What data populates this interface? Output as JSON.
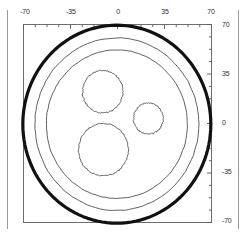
{
  "figure": {
    "background_color": "#ffffff",
    "frame_color": "#6e6e6e",
    "margin_rule_color": "#9a9a9a"
  },
  "axes": {
    "top": {
      "labels": [
        "-70",
        "-35",
        "0",
        "35",
        "70"
      ],
      "values": [
        -70,
        -35,
        0,
        35,
        70
      ]
    },
    "right": {
      "labels": [
        "70",
        "35",
        "0",
        "-35",
        "-70"
      ],
      "values": [
        70,
        35,
        0,
        -35,
        -70
      ]
    },
    "minor_ticks_per_interval": 4
  },
  "chart_data": {
    "type": "line",
    "xlabel": "",
    "ylabel": "",
    "xlim": [
      -70,
      70
    ],
    "ylim": [
      -70,
      70
    ],
    "grid": false,
    "legend": "none",
    "x_ticks": [
      -70,
      -35,
      0,
      35,
      70
    ],
    "y_ticks": [
      -70,
      -35,
      0,
      35,
      70
    ],
    "x_tick_labels": [
      "-70",
      "-35",
      "0",
      "35",
      "70"
    ],
    "y_tick_labels": [
      "-70",
      "-35",
      "0",
      "35",
      "70"
    ],
    "minor_tick_step": 8.75,
    "units": "mm",
    "series": [
      {
        "name": "outer-sheath",
        "shape": "circle",
        "center": [
          -0.5,
          -0.5
        ],
        "radius": 70.0,
        "stroke": "#111111",
        "stroke_width": 3.2,
        "roughness": 0.0
      },
      {
        "name": "outer-insulation",
        "shape": "circle",
        "center": [
          -0.5,
          -0.5
        ],
        "radius": 61.0,
        "stroke": "#3a3a3a",
        "stroke_width": 0.8,
        "roughness": 0.6
      },
      {
        "name": "inner-bedding",
        "shape": "circle",
        "center": [
          -0.5,
          -0.5
        ],
        "radius": 52.5,
        "stroke": "#3a3a3a",
        "stroke_width": 0.8,
        "roughness": 0.6
      },
      {
        "name": "conductor-upper-left",
        "shape": "circle",
        "center": [
          -11.0,
          22.5
        ],
        "radius": 15.0,
        "stroke": "#555555",
        "stroke_width": 0.9,
        "roughness": 1.1
      },
      {
        "name": "conductor-right",
        "shape": "circle",
        "center": [
          23.0,
          3.5
        ],
        "radius": 11.0,
        "stroke": "#555555",
        "stroke_width": 0.9,
        "roughness": 1.1
      },
      {
        "name": "conductor-lower",
        "shape": "circle",
        "center": [
          -10.5,
          -18.5
        ],
        "radius": 18.5,
        "stroke": "#555555",
        "stroke_width": 0.9,
        "roughness": 1.1
      }
    ]
  }
}
